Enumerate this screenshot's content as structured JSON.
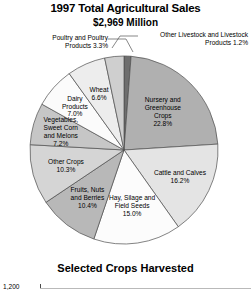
{
  "chart_data": {
    "type": "pie",
    "title": "1997 Total Agricultural Sales",
    "subtitle": "$2,969 Million",
    "total_label": "$2,969 Million",
    "units": "percent of total sales",
    "legend": "none",
    "grid": false,
    "categories": [
      "Other Livestock and Livestock Products",
      "Nursery and Greenhouse Crops",
      "Cattle and Calves",
      "Hay, Silage and Field Seeds",
      "Fruits, Nuts and Berries",
      "Other Crops",
      "Vegetables, Sweet Corn and Melons",
      "Dairy Products",
      "Wheat",
      "Poultry and Poultry Products"
    ],
    "values": [
      1.2,
      22.8,
      16.2,
      15.0,
      10.4,
      10.3,
      7.2,
      7.0,
      6.6,
      3.3
    ],
    "slices": [
      {
        "name": "Other Livestock and Livestock Products",
        "value": 1.2,
        "value_label": "1.2%",
        "label_lines": [
          "Other Livestock and Livestock",
          "Products 1.2%"
        ],
        "color": "#6e6e6e",
        "placement": "callout"
      },
      {
        "name": "Nursery and Greenhouse Crops",
        "value": 22.8,
        "value_label": "22.8%",
        "label_lines": [
          "Nursery and",
          "Greenhouse",
          "Crops",
          "22.8%"
        ],
        "color": "#b0b0b0",
        "placement": "inside"
      },
      {
        "name": "Cattle and Calves",
        "value": 16.2,
        "value_label": "16.2%",
        "label_lines": [
          "Cattle and Calves",
          "16.2%"
        ],
        "color": "#e4e4e4",
        "placement": "inside"
      },
      {
        "name": "Hay, Silage and Field Seeds",
        "value": 15.0,
        "value_label": "15.0%",
        "label_lines": [
          "Hay, Silage and",
          "Field Seeds",
          "15.0%"
        ],
        "color": "#fcfcfc",
        "placement": "inside"
      },
      {
        "name": "Fruits, Nuts and Berries",
        "value": 10.4,
        "value_label": "10.4%",
        "label_lines": [
          "Fruits, Nuts",
          "and Berries",
          "10.4%"
        ],
        "color": "#b8b8b8",
        "placement": "inside"
      },
      {
        "name": "Other Crops",
        "value": 10.3,
        "value_label": "10.3%",
        "label_lines": [
          "Other Crops",
          "10.3%"
        ],
        "color": "#d5d5d5",
        "placement": "inside"
      },
      {
        "name": "Vegetables, Sweet Corn and Melons",
        "value": 7.2,
        "value_label": "7.2%",
        "label_lines": [
          "Vegetables,",
          "Sweet Corn",
          "and Melons",
          "7.2%"
        ],
        "color": "#c6c6c6",
        "placement": "inside"
      },
      {
        "name": "Dairy Products",
        "value": 7.0,
        "value_label": "7.0%",
        "label_lines": [
          "Dairy",
          "Products",
          "7.0%"
        ],
        "color": "#fbfbfb",
        "placement": "inside"
      },
      {
        "name": "Wheat",
        "value": 6.6,
        "value_label": "6.6%",
        "label_lines": [
          "Wheat",
          "6.6%"
        ],
        "color": "#ededed",
        "placement": "inside"
      },
      {
        "name": "Poultry and Poultry Products",
        "value": 3.3,
        "value_label": "3.3%",
        "label_lines": [
          "Poultry and Poultry",
          "Products 3.3%"
        ],
        "color": "#cfcfcf",
        "placement": "callout"
      }
    ]
  },
  "callouts": {
    "poultry": {
      "line1": "Poultry and Poultry",
      "line2": "Products 3.3%"
    },
    "other_livestock": {
      "line1": "Other Livestock and Livestock",
      "line2": "Products 1.2%"
    }
  },
  "bottom_chart": {
    "title": "Selected Crops Harvested",
    "axis_first_tick": "1,200"
  }
}
